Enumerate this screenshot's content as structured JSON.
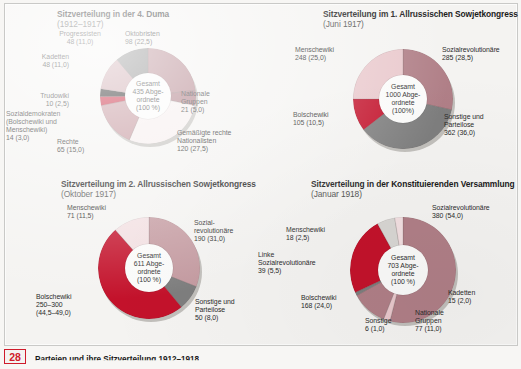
{
  "page": {
    "number": "28",
    "caption": "Parteien und ihre Sitzverteilung 1912–1918",
    "background": "#f4f3f1"
  },
  "palette": {
    "dark_rose": "#b07f87",
    "rose": "#c49aa0",
    "light_pink": "#e3c2c6",
    "pale_pink": "#f2dfe1",
    "very_pale": "#f7ecec",
    "near_white": "#f6eeee",
    "grey": "#7e7e7e",
    "light_grey": "#d8d6d3",
    "crimson": "#c3122b",
    "dark_red": "#b1102a",
    "black": "#101010",
    "shadow": "#b9b6b2",
    "hole": "#fbfbfa",
    "badge_red": "#cf1b2b"
  },
  "chart_data": [
    {
      "id": "duma4",
      "type": "pie",
      "title": "Sitzverteilung in der 4. Duma",
      "date": "(1912–1917)",
      "center_label": "Gesamt\n435 Abge-\nordnete\n(100 %)",
      "total": 435,
      "unit": "Abgeordnete",
      "categories": [
        "Oktobristen",
        "Nationale Gruppen",
        "Gemäßigte rechte Nationalisten",
        "Rechte",
        "Sozialdemokraten (Bolschewiki und Menschewiki)",
        "Trudowiki",
        "Kadetten",
        "Progressisten"
      ],
      "values": [
        98,
        21,
        120,
        65,
        14,
        10,
        48,
        48
      ],
      "percentages": [
        22.5,
        5.0,
        27.5,
        15.0,
        3.0,
        2.5,
        11.0,
        11.0
      ],
      "colors": [
        "#b07f87",
        "#a8757e",
        "#f6eeee",
        "#c08f96",
        "#c3122b",
        "#101010",
        "#c8a0a6",
        "#7e7e7e"
      ],
      "slices": [
        {
          "label": "Oktobristen",
          "value": "98 (22,5)",
          "pct": 22.5,
          "color": "#b07f87"
        },
        {
          "label": "Nationale\nGruppen",
          "value": "21 (5,0)",
          "pct": 5.0,
          "color": "#a8757e"
        },
        {
          "label": "Gemäßigte rechte\nNationalisten",
          "value": "120 (27,5)",
          "pct": 27.5,
          "color": "#f6eeee"
        },
        {
          "label": "Rechte",
          "value": "65 (15,0)",
          "pct": 15.0,
          "color": "#c08f96"
        },
        {
          "label": "Sozialdemokraten\n(Bolschewiki und\nMenschewiki)",
          "value": "14 (3,0)",
          "pct": 3.0,
          "color": "#c3122b"
        },
        {
          "label": "Trudowiki",
          "value": "10 (2,5)",
          "pct": 2.5,
          "color": "#101010"
        },
        {
          "label": "Kadetten",
          "value": "48 (11,0)",
          "pct": 11.0,
          "color": "#c8a0a6"
        },
        {
          "label": "Progressisten",
          "value": "48 (11,0)",
          "pct": 11.0,
          "color": "#7e7e7e"
        }
      ],
      "labels": {
        "progressisten": "Progressisten\n48 (11,0)",
        "oktobristen": "Oktobristen\n98 (22,5)",
        "kadetten": "Kadetten\n48 (11,0)",
        "trudowiki": "Trudowiki\n10 (2,5)",
        "sozialdemokraten": "Sozialdemokraten\n(Bolschewiki und\nMenschewiki)\n14 (3,0)",
        "rechte": "Rechte\n65 (15,0)",
        "nationale": "Nationale\nGruppen\n21 (5,0)",
        "gemaessigte": "Gemäßigte rechte\nNationalisten\n120 (27,5)"
      }
    },
    {
      "id": "sowjet1",
      "type": "pie",
      "title": "Sitzverteilung im 1. Allrussischen Sowjetkongress",
      "date": "(Juni 1917)",
      "center_label": "Gesamt\n1000 Abge-\nordnete\n(100%)",
      "total": 1000,
      "unit": "Abgeordnete",
      "categories": [
        "Sozialrevolutionäre",
        "Sonstige und Parteilose",
        "Bolschewiki",
        "Menschewiki"
      ],
      "values": [
        285,
        362,
        105,
        248
      ],
      "percentages": [
        28.5,
        36.0,
        10.5,
        25.0
      ],
      "colors": [
        "#b07f87",
        "#7e7e7e",
        "#c3122b",
        "#e9c8cc"
      ],
      "slices": [
        {
          "label": "Sozialrevolutionäre",
          "value": "285 (28,5)",
          "pct": 28.5,
          "color": "#b07f87"
        },
        {
          "label": "Sonstige und\nParteilose",
          "value": "362 (36,0)",
          "pct": 36.0,
          "color": "#7e7e7e"
        },
        {
          "label": "Bolschewiki",
          "value": "105 (10,5)",
          "pct": 10.5,
          "color": "#c3122b"
        },
        {
          "label": "Menschewiki",
          "value": "248 (25,0)",
          "pct": 25.0,
          "color": "#e9c8cc"
        }
      ],
      "labels": {
        "menschewiki": "Menschewiki\n248 (25,0)",
        "sozialrevolutionaere": "Sozialrevolutionäre\n285 (28,5)",
        "bolschewiki": "Bolschewiki\n105 (10,5)",
        "sonstige": "Sonstige und\nParteilose\n362 (36,0)"
      }
    },
    {
      "id": "sowjet2",
      "type": "pie",
      "title": "Sitzverteilung im 2. Allrussischen Sowjetkongress",
      "date": "(Oktober 1917)",
      "center_label": "Gesamt\n611 Abge-\nordnete\n(100 %)",
      "total": 611,
      "unit": "Abgeordnete",
      "categories": [
        "Sozialrevolutionäre",
        "Sonstige und Parteilose",
        "Bolschewiki",
        "Menschewiki"
      ],
      "values": [
        190,
        50,
        275,
        71
      ],
      "percentages": [
        31.0,
        8.0,
        46.75,
        11.5
      ],
      "colors": [
        "#c49aa0",
        "#7e7e7e",
        "#c3122b",
        "#f2dfe1"
      ],
      "slices": [
        {
          "label": "Sozial-\nrevolutionäre",
          "value": "190 (31,0)",
          "pct": 31.0,
          "color": "#c49aa0"
        },
        {
          "label": "Sonstige und\nParteilose",
          "value": "50 (8,0)",
          "pct": 8.0,
          "color": "#7e7e7e"
        },
        {
          "label": "Bolschewiki",
          "value": "250–300 (44,5–49,0)",
          "pct": 49.5,
          "color": "#c3122b"
        },
        {
          "label": "Menschewiki",
          "value": "71 (11,5)",
          "pct": 11.5,
          "color": "#f2dfe1"
        }
      ],
      "labels": {
        "menschewiki": "Menschewiki\n71 (11,5)",
        "sozialrevolutionaere": "Sozial-\nrevolutionäre\n190 (31,0)",
        "bolschewiki": "Bolschewiki\n250–300\n(44,5–49,0)",
        "sonstige": "Sonstige und\nParteilose\n50 (8,0)"
      }
    },
    {
      "id": "konstituierende",
      "type": "pie",
      "title": "Sitzverteilung in der Konstituierenden Versammlung",
      "date": "(Januar 1918)",
      "center_label": "Gesamt\n703 Abge-\nordnete\n(100 %)",
      "total": 703,
      "unit": "Abgeordnete",
      "categories": [
        "Sozialrevolutionäre",
        "Kadetten",
        "Nationale Gruppen",
        "Sonstige",
        "Bolschewiki",
        "Linke Sozialrevolutionäre",
        "Menschewiki"
      ],
      "values": [
        380,
        15,
        77,
        6,
        168,
        39,
        18
      ],
      "percentages": [
        54.0,
        2.0,
        11.0,
        1.0,
        24.0,
        5.5,
        2.5
      ],
      "colors": [
        "#b07f87",
        "#e9c8cc",
        "#b07f87",
        "#7e7e7e",
        "#c3122b",
        "#d8d6d3",
        "#f2dfe1"
      ],
      "slices": [
        {
          "label": "Sozialrevolutionäre",
          "value": "380 (54,0)",
          "pct": 54.0,
          "color": "#b07f87"
        },
        {
          "label": "Kadetten",
          "value": "15 (2,0)",
          "pct": 2.0,
          "color": "#e9c8cc"
        },
        {
          "label": "Nationale\nGruppen",
          "value": "77 (11,0)",
          "pct": 11.0,
          "color": "#b07f87"
        },
        {
          "label": "Sonstige",
          "value": "6 (1,0)",
          "pct": 1.0,
          "color": "#7e7e7e"
        },
        {
          "label": "Bolschewiki",
          "value": "168 (24,0)",
          "pct": 24.0,
          "color": "#c3122b"
        },
        {
          "label": "Linke\nSozialrevolutionäre",
          "value": "39 (5,5)",
          "pct": 5.5,
          "color": "#d8d6d3"
        },
        {
          "label": "Menschewiki",
          "value": "18 (2,5)",
          "pct": 2.5,
          "color": "#f2dfe1"
        }
      ],
      "labels": {
        "sozialrevolutionaere": "Sozialrevolutionäre\n380 (54,0)",
        "menschewiki": "Menschewiki\n18 (2,5)",
        "linke": "Linke\nSozialrevolutionäre\n39 (5,5)",
        "bolschewiki": "Bolschewiki\n168 (24,0)",
        "sonstige": "Sonstige\n6 (1,0)",
        "nationale": "Nationale\nGruppen\n77 (11,0)",
        "kadetten": "Kadetten\n15 (2,0)"
      }
    }
  ]
}
